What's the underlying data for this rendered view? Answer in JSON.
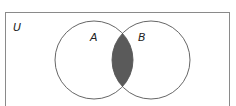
{
  "diagram": {
    "type": "venn",
    "universe_label": "U",
    "sets": [
      {
        "label": "A",
        "cx": 94,
        "cy": 60,
        "r": 39
      },
      {
        "label": "B",
        "cx": 151,
        "cy": 60,
        "r": 39
      }
    ],
    "shaded_region": "A ∩ B",
    "colors": {
      "shade": "#5a5a5a",
      "stroke": "#555555",
      "border": "#8a8a8a",
      "background": "#ffffff"
    }
  }
}
